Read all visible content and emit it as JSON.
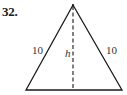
{
  "problem": {
    "number": "32."
  },
  "figure": {
    "shape": "isosceles-triangle",
    "stroke_color": "#1a1a1a",
    "labels": {
      "left_side": "10",
      "right_side": "10",
      "height": "h"
    },
    "vertices": {
      "apex": [
        73,
        5
      ],
      "base_left": [
        26,
        90
      ],
      "base_right": [
        122,
        90
      ]
    },
    "altitude": {
      "from": [
        73,
        5
      ],
      "to": [
        73,
        90
      ],
      "style": "dashed"
    }
  }
}
